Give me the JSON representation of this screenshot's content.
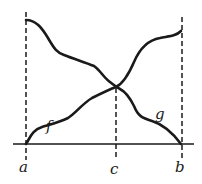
{
  "figure": {
    "type": "diagram",
    "colors": {
      "stroke": "#1a1a1a",
      "background": "#ffffff"
    },
    "labels": {
      "a": "a",
      "b": "b",
      "c": "c",
      "f": "f",
      "g": "g"
    },
    "axis": {
      "y": 144,
      "x_start": 13,
      "x_end": 194
    },
    "verticals": [
      {
        "name": "a",
        "x": 26,
        "y_top": 12,
        "y_bottom": 160
      },
      {
        "name": "c",
        "x": 116,
        "y_top": 88,
        "y_bottom": 160
      },
      {
        "name": "b",
        "x": 182,
        "y_top": 17,
        "y_bottom": 160
      }
    ],
    "curves": [
      {
        "name": "f",
        "from": [
          26,
          144
        ],
        "to": [
          181,
          31
        ],
        "shape": "increasing"
      },
      {
        "name": "g",
        "from": [
          26,
          20
        ],
        "to": [
          181,
          144
        ],
        "shape": "decreasing"
      }
    ],
    "intersection": [
      116,
      87
    ]
  }
}
